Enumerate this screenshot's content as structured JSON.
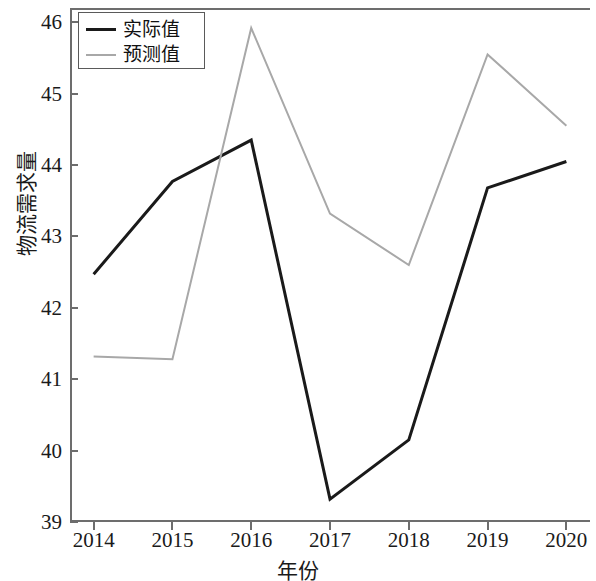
{
  "chart_data": {
    "type": "line",
    "title": "",
    "xlabel": "年份",
    "ylabel": "物流需求量",
    "x": [
      2014,
      2015,
      2016,
      2017,
      2018,
      2019,
      2020
    ],
    "xticklabels": [
      "2014",
      "2015",
      "2016",
      "2017",
      "2018",
      "2019",
      "2020"
    ],
    "yticklabels": [
      "39",
      "40",
      "41",
      "42",
      "43",
      "44",
      "45",
      "46"
    ],
    "yticks": [
      39,
      40,
      41,
      42,
      43,
      44,
      45,
      46
    ],
    "ylim": [
      39,
      46.2
    ],
    "xlim": [
      2013.7,
      2020.3
    ],
    "grid": false,
    "legend_position": "upper left",
    "series": [
      {
        "name": "实际值",
        "color": "#1a1a1a",
        "width": 3,
        "values": [
          42.47,
          43.77,
          44.35,
          39.32,
          40.15,
          43.68,
          44.05
        ]
      },
      {
        "name": "预测值",
        "color": "#a8a8a8",
        "width": 2,
        "values": [
          41.32,
          41.28,
          45.92,
          43.32,
          42.6,
          45.55,
          44.55
        ]
      }
    ]
  },
  "axes": {
    "spine_color": "#6d6d6d",
    "background": "#ffffff"
  }
}
